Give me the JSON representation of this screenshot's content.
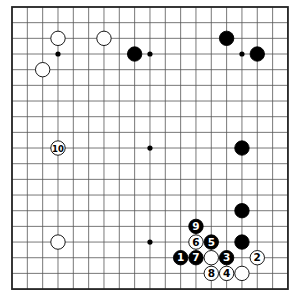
{
  "board": {
    "size": 19,
    "origin_x": 12,
    "origin_y": 7,
    "spacing_x": 15.33,
    "spacing_y": 15.67,
    "line_color": "#555555",
    "border_color": "#222222",
    "stone_radius": 7.2
  },
  "star_points": [
    {
      "col": 3,
      "row": 3
    },
    {
      "col": 9,
      "row": 3
    },
    {
      "col": 15,
      "row": 3
    },
    {
      "col": 9,
      "row": 9
    },
    {
      "col": 9,
      "row": 15
    }
  ],
  "stones": [
    {
      "col": 3,
      "row": 2,
      "color": "white",
      "label": ""
    },
    {
      "col": 6,
      "row": 2,
      "color": "white",
      "label": ""
    },
    {
      "col": 2,
      "row": 4,
      "color": "white",
      "label": ""
    },
    {
      "col": 8,
      "row": 3,
      "color": "black",
      "label": ""
    },
    {
      "col": 14,
      "row": 2,
      "color": "black",
      "label": ""
    },
    {
      "col": 16,
      "row": 3,
      "color": "black",
      "label": ""
    },
    {
      "col": 3,
      "row": 9,
      "color": "white",
      "label": "10"
    },
    {
      "col": 15,
      "row": 9,
      "color": "black",
      "label": ""
    },
    {
      "col": 15,
      "row": 13,
      "color": "black",
      "label": ""
    },
    {
      "col": 3,
      "row": 15,
      "color": "white",
      "label": ""
    },
    {
      "col": 12,
      "row": 14,
      "color": "black",
      "label": "9"
    },
    {
      "col": 12,
      "row": 15,
      "color": "white",
      "label": "6"
    },
    {
      "col": 13,
      "row": 15,
      "color": "black",
      "label": "5"
    },
    {
      "col": 15,
      "row": 15,
      "color": "black",
      "label": ""
    },
    {
      "col": 11,
      "row": 16,
      "color": "black",
      "label": "1"
    },
    {
      "col": 12,
      "row": 16,
      "color": "black",
      "label": "7"
    },
    {
      "col": 13,
      "row": 16,
      "color": "white",
      "label": ""
    },
    {
      "col": 14,
      "row": 16,
      "color": "black",
      "label": "3"
    },
    {
      "col": 16,
      "row": 16,
      "color": "white",
      "label": "2"
    },
    {
      "col": 13,
      "row": 17,
      "color": "white",
      "label": "8"
    },
    {
      "col": 14,
      "row": 17,
      "color": "white",
      "label": "4"
    },
    {
      "col": 15,
      "row": 17,
      "color": "white",
      "label": ""
    }
  ]
}
